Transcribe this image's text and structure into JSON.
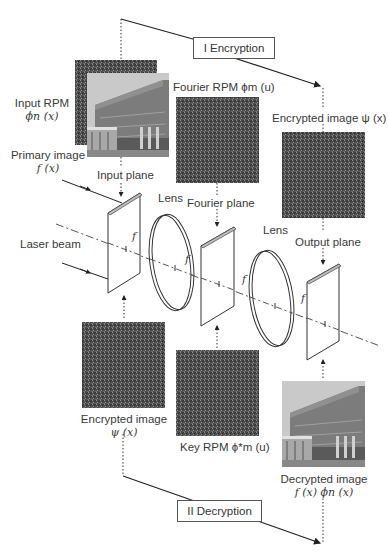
{
  "diagram": {
    "stages": {
      "encryption": "I Encryption",
      "decryption": "II Decryption"
    },
    "labels": {
      "input_rpm": "Input RPM",
      "input_rpm_sym": "ϕn (x)",
      "primary_image": "Primary image",
      "primary_image_sym": "f (x)",
      "fourier_rpm": "Fourier RPM ϕm (u)",
      "encrypted_image_top": "Encrypted image ψ (x)",
      "input_plane": "Input plane",
      "lens_1": "Lens",
      "fourier_plane": "Fourier plane",
      "lens_2": "Lens",
      "output_plane": "Output plane",
      "laser_beam": "Laser beam",
      "encrypted_image_bottom": "Encrypted image",
      "encrypted_image_bottom_sym": "ψ (x)",
      "key_rpm": "Key RPM ϕ*m (u)",
      "decrypted_image": "Decrypted image",
      "decrypted_image_sym": "f (x) ϕn (x)",
      "focal": "f"
    },
    "colors": {
      "line": "#333333",
      "noise": "#4a4a4a",
      "photo_sky": "#c8c8c8",
      "photo_building": "#7a7a7a"
    }
  }
}
